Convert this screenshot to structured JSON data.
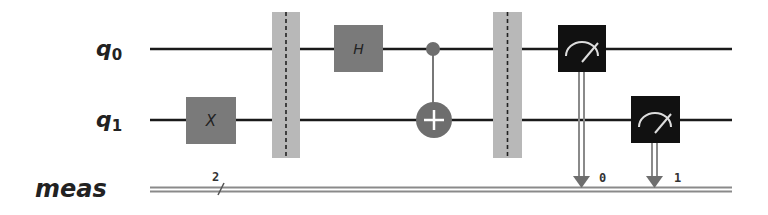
{
  "registers": {
    "q0": {
      "label_main": "q",
      "label_sub": "0"
    },
    "q1": {
      "label_main": "q",
      "label_sub": "1"
    },
    "meas": {
      "label": "meas",
      "width_label": "2"
    }
  },
  "gates": [
    {
      "type": "X",
      "label": "X",
      "qubit": "q1",
      "column": 1
    },
    {
      "type": "barrier",
      "qubits": [
        "q0",
        "q1"
      ],
      "column": 2
    },
    {
      "type": "H",
      "label": "H",
      "qubit": "q0",
      "column": 3
    },
    {
      "type": "CX",
      "control": "q0",
      "target": "q1",
      "column": 4
    },
    {
      "type": "barrier",
      "qubits": [
        "q0",
        "q1"
      ],
      "column": 5
    },
    {
      "type": "measure",
      "qubit": "q0",
      "clbit": "0",
      "column": 6
    },
    {
      "type": "measure",
      "qubit": "q1",
      "clbit": "1",
      "column": 7
    }
  ],
  "labels": {
    "x_gate": "X",
    "h_gate": "H",
    "clbit_0": "0",
    "clbit_1": "1"
  },
  "colors": {
    "wire": "#1a1a1a",
    "gate_fill": "#7a7a7a",
    "barrier_fill": "#b8b8b8",
    "measure_fill": "#111111",
    "cx_fill": "#6e6e6e",
    "classical_wire": "#8a8a8a"
  }
}
